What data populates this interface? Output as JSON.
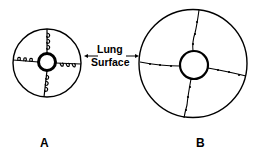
{
  "diagram": {
    "center_label_line1": "Lung",
    "center_label_line2": "Surface",
    "panels": [
      {
        "id": "A",
        "label": "A"
      },
      {
        "id": "B",
        "label": "B"
      }
    ],
    "colors": {
      "stroke": "#000000",
      "background": "#ffffff"
    }
  }
}
